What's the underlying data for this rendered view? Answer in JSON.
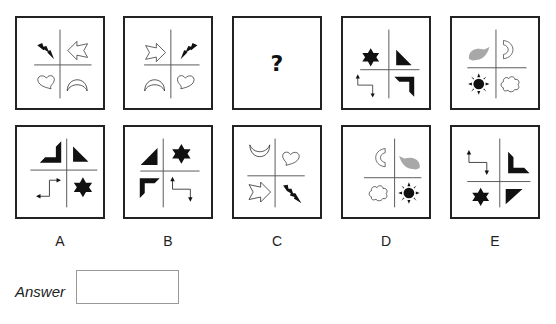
{
  "question": {
    "sequence": [
      {
        "id": "seq-1",
        "quadrants": {
          "top_left": "lightning-black",
          "top_right": "arrow-left-outline",
          "bottom_left": "heart-outline",
          "bottom_right": "crescent-up-outline"
        }
      },
      {
        "id": "seq-2",
        "quadrants": {
          "top_left": "arrow-right-outline",
          "top_right": "lightning-black",
          "bottom_left": "crescent-up-outline",
          "bottom_right": "heart-outline"
        }
      },
      {
        "id": "seq-3",
        "placeholder": "?"
      },
      {
        "id": "seq-4",
        "quadrants": {
          "top_left": "star-black",
          "top_right": "triangle-black",
          "bottom_left": "zigzag-arrow",
          "bottom_right": "chevron-corner-black"
        }
      },
      {
        "id": "seq-5",
        "quadrants": {
          "top_left": "leaf-grey",
          "top_right": "crescent-right-outline",
          "bottom_left": "sun-black",
          "bottom_right": "cloud-outline"
        }
      }
    ]
  },
  "options": [
    {
      "label": "A",
      "quadrants": {
        "top_left": "chevron-corner-black",
        "top_right": "triangle-black",
        "bottom_left": "zigzag-arrow",
        "bottom_right": "star-black"
      }
    },
    {
      "label": "B",
      "quadrants": {
        "top_left": "triangle-black",
        "top_right": "star-black",
        "bottom_left": "chevron-corner-black",
        "bottom_right": "zigzag-arrow"
      }
    },
    {
      "label": "C",
      "quadrants": {
        "top_left": "crescent-down-outline",
        "top_right": "heart-outline",
        "bottom_left": "arrow-right-outline",
        "bottom_right": "lightning-black"
      }
    },
    {
      "label": "D",
      "quadrants": {
        "top_left": "crescent-left-outline",
        "top_right": "leaf-grey",
        "bottom_left": "cloud-outline",
        "bottom_right": "sun-black"
      }
    },
    {
      "label": "E",
      "quadrants": {
        "top_left": "zigzag-arrow",
        "top_right": "chevron-corner-black",
        "bottom_left": "star-black",
        "bottom_right": "triangle-black"
      }
    }
  ],
  "answer": {
    "label": "Answer",
    "value": ""
  },
  "colors": {
    "border": "#222222",
    "shape_black": "#111111",
    "shape_grey": "#a8a8a8",
    "line": "#555555",
    "answer_border": "#999999"
  }
}
